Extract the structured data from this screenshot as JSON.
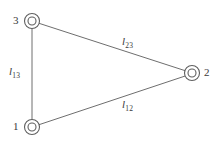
{
  "figure": {
    "type": "triangle-network-diagram",
    "background_color": "#ffffff",
    "stroke_color": "#6e6e6e",
    "text_color": "#3a3a3a",
    "width": 221,
    "height": 144
  },
  "nodes": [
    {
      "id": "1",
      "label": "1",
      "cx": 32,
      "cy": 127,
      "outer_r": 7.5,
      "inner_r": 4,
      "label_x": 13,
      "label_y": 121
    },
    {
      "id": "2",
      "label": "2",
      "cx": 192,
      "cy": 73,
      "outer_r": 7.5,
      "inner_r": 4,
      "label_x": 204,
      "label_y": 67
    },
    {
      "id": "3",
      "label": "3",
      "cx": 32,
      "cy": 21,
      "outer_r": 7.5,
      "inner_r": 4,
      "label_x": 13,
      "label_y": 15
    }
  ],
  "edges": [
    {
      "id": "l13",
      "from": "1",
      "to": "3",
      "symbol": "l",
      "subscript": "13",
      "x1": 32,
      "y1": 28.5,
      "x2": 32,
      "y2": 119.5,
      "label_x": 9,
      "label_y": 66
    },
    {
      "id": "l23",
      "from": "2",
      "to": "3",
      "symbol": "l",
      "subscript": "23",
      "x1": 39.3,
      "y1": 23.4,
      "x2": 184.9,
      "y2": 70.6,
      "label_x": 122,
      "label_y": 36
    },
    {
      "id": "l12",
      "from": "1",
      "to": "2",
      "symbol": "l",
      "subscript": "12",
      "x1": 39.3,
      "y1": 124.6,
      "x2": 184.9,
      "y2": 76.1,
      "label_x": 122,
      "label_y": 99
    }
  ]
}
